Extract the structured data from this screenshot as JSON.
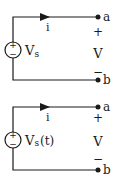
{
  "circuits": [
    {
      "source_label": "V",
      "source_subscript": "s",
      "source_suffix": "",
      "current_label": "i",
      "node_top": "a",
      "node_bottom": "b",
      "plus": "+",
      "minus": "−",
      "voltage_label": "V",
      "source_plus": "+",
      "source_minus": "−"
    },
    {
      "source_label": "V",
      "source_subscript": "s",
      "source_suffix": "(t)",
      "current_label": "i",
      "node_top": "a",
      "node_bottom": "b",
      "plus": "+",
      "minus": "−",
      "voltage_label": "V",
      "source_plus": "+",
      "source_minus": "−"
    }
  ],
  "colors": {
    "line": "#1a1a1a",
    "background": "#ffffff"
  }
}
